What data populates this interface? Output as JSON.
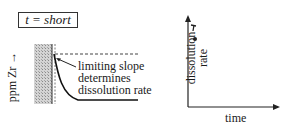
{
  "left_panel": {
    "title": "t = short",
    "y_axis_label": "ppm Zr →",
    "annotation": {
      "line1": "limiting slope",
      "line2": "determines",
      "line3": "dissolution rate"
    }
  },
  "right_panel": {
    "y_axis_label_line1": "dissolution",
    "y_axis_label_line2": "rate",
    "x_axis_label": "time",
    "points": [
      {
        "label": "arrow-marker",
        "t": 0.05,
        "rate": 0.85
      },
      {
        "label": "dot-marker",
        "t": 0.08,
        "rate": 0.7
      }
    ]
  },
  "colors": {
    "ink": "#1a1a1a",
    "hatch": "#bdbdbd",
    "background": "#ffffff"
  }
}
